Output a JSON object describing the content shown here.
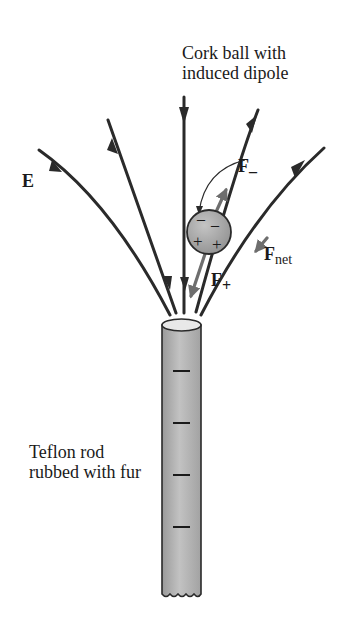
{
  "labels": {
    "cork_ball_line1": "Cork ball with",
    "cork_ball_line2": "induced dipole",
    "field": "E",
    "f_minus_main": "F",
    "f_minus_sub": "–",
    "f_plus_main": "F",
    "f_plus_sub": "+",
    "f_net_main": "F",
    "f_net_sub": "net",
    "rod_line1": "Teflon rod",
    "rod_line2": "rubbed with fur"
  },
  "ball_charges": {
    "top": [
      "–",
      "–"
    ],
    "bottom": [
      "+",
      "+"
    ]
  },
  "rod_charges": [
    "–",
    "–",
    "–",
    "–"
  ],
  "colors": {
    "field_line": "#2a2a2a",
    "force_arrow": "#6e6e6e",
    "ball_fill": "#a8a8a8",
    "rod_fill": "#b4b4b4",
    "text": "#1a1a1a"
  }
}
